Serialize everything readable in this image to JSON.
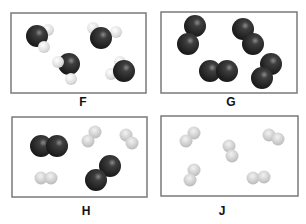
{
  "panels": [
    {
      "id": "F",
      "label": "F",
      "description": "Four water-like molecules: one large dark atom with two small light atoms",
      "box": {
        "x": 11,
        "y": 13,
        "w": 135,
        "h": 80
      },
      "label_pos": {
        "x": 74,
        "y": 103
      }
    },
    {
      "id": "G",
      "label": "G",
      "description": "Four diatomic molecules of dark atoms",
      "box": {
        "x": 161,
        "y": 12,
        "w": 136,
        "h": 81
      },
      "label_pos": {
        "x": 225,
        "y": 103
      }
    },
    {
      "id": "H",
      "label": "H",
      "description": "Mixture: two dark diatomic molecules and three light diatomic molecules",
      "box": {
        "x": 12,
        "y": 117,
        "w": 135,
        "h": 80
      },
      "label_pos": {
        "x": 79,
        "y": 212
      }
    },
    {
      "id": "J",
      "label": "J",
      "description": "Five diatomic molecules of light atoms",
      "box": {
        "x": 161,
        "y": 116,
        "w": 137,
        "h": 80
      },
      "label_pos": {
        "x": 217,
        "y": 212
      }
    }
  ],
  "colors": {
    "dark_atom": "#2a2a2a",
    "light_atom": "#c8c8c8",
    "box_border": "#7a7a7a"
  }
}
